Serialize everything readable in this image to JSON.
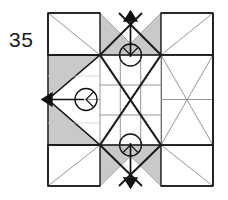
{
  "figure": {
    "number": "35",
    "type": "origami-folding-diagram",
    "background_color": "#ffffff",
    "line_color": "#1a1a1a",
    "thin_line_color": "#8a8a8a",
    "shade_color": "#c9c9c9",
    "shade_edge_color": "#9a9a9a",
    "arrow_color": "#111111"
  },
  "geometry": {
    "outer_left": 48,
    "outer_top": 13,
    "outer_right": 213,
    "outer_bottom": 186,
    "center_x": 130.5,
    "center_y": 99.5,
    "inner_left": 100,
    "inner_top": 55,
    "inner_right": 161,
    "inner_bottom": 145,
    "cell": 20.3
  },
  "arrows": [
    {
      "name": "arrow-up",
      "direction": "up",
      "circle_cx": 130.5,
      "circle_cy": 55,
      "circle_r": 11,
      "tail_x": 130.5,
      "tail_y": 55,
      "head_x": 130.5,
      "head_y": 16
    },
    {
      "name": "arrow-left",
      "direction": "left",
      "circle_cx": 86,
      "circle_cy": 99.5,
      "circle_r": 11,
      "tail_x": 86,
      "tail_y": 99.5,
      "head_x": 47,
      "head_y": 99.5
    },
    {
      "name": "arrow-down",
      "direction": "down",
      "circle_cx": 130.5,
      "circle_cy": 145,
      "circle_r": 11,
      "tail_x": 130.5,
      "tail_y": 145,
      "head_x": 130.5,
      "head_y": 184
    }
  ],
  "shaded_regions": [
    {
      "name": "shade-top-left-wing",
      "points": "100,13 140,55 100,55"
    },
    {
      "name": "shade-top-right-wing",
      "points": "161,13 121,55 161,55"
    },
    {
      "name": "shade-left-upper",
      "points": "48,55 100,55 48,99.5"
    },
    {
      "name": "shade-left-lower",
      "points": "48,145 100,145 48,99.5"
    },
    {
      "name": "shade-bottom-left-wing",
      "points": "100,186 140,145 100,145"
    },
    {
      "name": "shade-bottom-right-wing",
      "points": "161,186 121,145 161,145"
    }
  ],
  "labels": {
    "step_number": "35"
  }
}
